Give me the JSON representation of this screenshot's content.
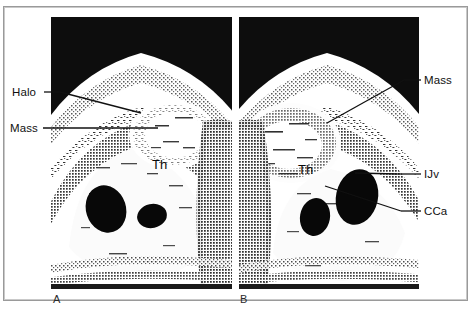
{
  "figure": {
    "kind": "medical-ultrasound-figure",
    "panel_count": 2,
    "background_color": "#ffffff",
    "frame_color": "#9a9a9a",
    "ink_color": "#101010",
    "scan_background": "#0d0d0d"
  },
  "panels": [
    {
      "id": "A",
      "letter": "A",
      "tissue_labels": [
        {
          "name": "thyroid",
          "text": "Th"
        }
      ]
    },
    {
      "id": "B",
      "letter": "B",
      "tissue_labels": [
        {
          "name": "thyroid",
          "text": "Th"
        }
      ]
    }
  ],
  "annotations": [
    {
      "id": "halo",
      "text": "Halo",
      "side": "left",
      "panel": "A"
    },
    {
      "id": "mass_left",
      "text": "Mass",
      "side": "left",
      "panel": "A"
    },
    {
      "id": "mass_right",
      "text": "Mass",
      "side": "right",
      "panel": "B"
    },
    {
      "id": "ijv",
      "text": "IJv",
      "side": "right",
      "panel": "B"
    },
    {
      "id": "cca",
      "text": "CCa",
      "side": "right",
      "panel": "B"
    }
  ],
  "caption_sliver": {
    "text": ""
  }
}
